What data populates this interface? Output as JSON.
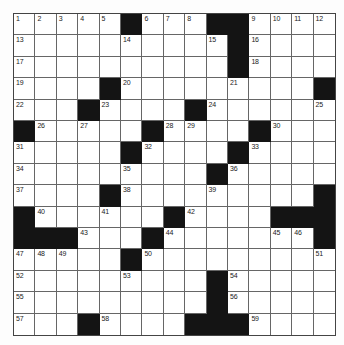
{
  "puzzle": {
    "rows": 15,
    "cols": 15,
    "colors": {
      "block": "#141414",
      "cell": "#ffffff",
      "grid_line": "#666666",
      "number": "#222222"
    },
    "layout": [
      ".....#...##....",
      "..........#....",
      "..........#....",
      "....#.........#",
      "...#....#......",
      "#.....#....#...",
      ".....#....#....",
      ".........#.....",
      "....#.........#",
      "#......#....###",
      "###...#.......#",
      ".....#.........",
      ".........#.....",
      ".........#.....",
      "...#....###...."
    ],
    "numbers": [
      {
        "row": 0,
        "col": 0,
        "n": "1"
      },
      {
        "row": 0,
        "col": 1,
        "n": "2"
      },
      {
        "row": 0,
        "col": 2,
        "n": "3"
      },
      {
        "row": 0,
        "col": 3,
        "n": "4"
      },
      {
        "row": 0,
        "col": 4,
        "n": "5"
      },
      {
        "row": 0,
        "col": 6,
        "n": "6"
      },
      {
        "row": 0,
        "col": 7,
        "n": "7"
      },
      {
        "row": 0,
        "col": 8,
        "n": "8"
      },
      {
        "row": 0,
        "col": 11,
        "n": "9"
      },
      {
        "row": 0,
        "col": 12,
        "n": "10"
      },
      {
        "row": 0,
        "col": 13,
        "n": "11"
      },
      {
        "row": 0,
        "col": 14,
        "n": "12"
      },
      {
        "row": 1,
        "col": 0,
        "n": "13"
      },
      {
        "row": 1,
        "col": 5,
        "n": "14"
      },
      {
        "row": 1,
        "col": 9,
        "n": "15"
      },
      {
        "row": 1,
        "col": 11,
        "n": "16"
      },
      {
        "row": 2,
        "col": 0,
        "n": "17"
      },
      {
        "row": 2,
        "col": 11,
        "n": "18"
      },
      {
        "row": 3,
        "col": 0,
        "n": "19"
      },
      {
        "row": 3,
        "col": 5,
        "n": "20"
      },
      {
        "row": 3,
        "col": 10,
        "n": "21"
      },
      {
        "row": 4,
        "col": 0,
        "n": "22"
      },
      {
        "row": 4,
        "col": 4,
        "n": "23"
      },
      {
        "row": 4,
        "col": 9,
        "n": "24"
      },
      {
        "row": 4,
        "col": 14,
        "n": "25"
      },
      {
        "row": 5,
        "col": 1,
        "n": "26"
      },
      {
        "row": 5,
        "col": 3,
        "n": "27"
      },
      {
        "row": 5,
        "col": 7,
        "n": "28"
      },
      {
        "row": 5,
        "col": 8,
        "n": "29"
      },
      {
        "row": 5,
        "col": 12,
        "n": "30"
      },
      {
        "row": 6,
        "col": 0,
        "n": "31"
      },
      {
        "row": 6,
        "col": 6,
        "n": "32"
      },
      {
        "row": 6,
        "col": 11,
        "n": "33"
      },
      {
        "row": 7,
        "col": 0,
        "n": "34"
      },
      {
        "row": 7,
        "col": 5,
        "n": "35"
      },
      {
        "row": 7,
        "col": 10,
        "n": "36"
      },
      {
        "row": 8,
        "col": 0,
        "n": "37"
      },
      {
        "row": 8,
        "col": 5,
        "n": "38"
      },
      {
        "row": 8,
        "col": 9,
        "n": "39"
      },
      {
        "row": 9,
        "col": 1,
        "n": "40"
      },
      {
        "row": 9,
        "col": 4,
        "n": "41"
      },
      {
        "row": 9,
        "col": 8,
        "n": "42"
      },
      {
        "row": 10,
        "col": 3,
        "n": "43"
      },
      {
        "row": 10,
        "col": 7,
        "n": "44"
      },
      {
        "row": 10,
        "col": 12,
        "n": "45"
      },
      {
        "row": 10,
        "col": 13,
        "n": "46"
      },
      {
        "row": 11,
        "col": 0,
        "n": "47"
      },
      {
        "row": 11,
        "col": 1,
        "n": "48"
      },
      {
        "row": 11,
        "col": 2,
        "n": "49"
      },
      {
        "row": 11,
        "col": 6,
        "n": "50"
      },
      {
        "row": 11,
        "col": 14,
        "n": "51"
      },
      {
        "row": 12,
        "col": 0,
        "n": "52"
      },
      {
        "row": 12,
        "col": 5,
        "n": "53"
      },
      {
        "row": 12,
        "col": 10,
        "n": "54"
      },
      {
        "row": 13,
        "col": 0,
        "n": "55"
      },
      {
        "row": 13,
        "col": 10,
        "n": "56"
      },
      {
        "row": 14,
        "col": 0,
        "n": "57"
      },
      {
        "row": 14,
        "col": 4,
        "n": "58"
      },
      {
        "row": 14,
        "col": 11,
        "n": "59"
      }
    ],
    "entries": []
  }
}
